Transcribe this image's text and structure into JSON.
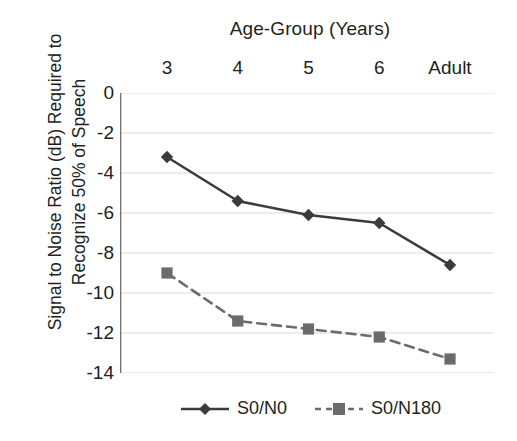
{
  "chart_data": {
    "type": "line",
    "title": "",
    "xlabel": "Age-Group (Years)",
    "ylabel": "Signal to Noise Ratio (dB) Required to\nRecognize 50% of Speech",
    "categories": [
      "3",
      "4",
      "5",
      "6",
      "Adult"
    ],
    "ylim": [
      -14,
      0
    ],
    "yticks": [
      0,
      -2,
      -4,
      -6,
      -8,
      -10,
      -12,
      -14
    ],
    "ytick_labels": [
      "0",
      "-2",
      "-4",
      "-6",
      "-8",
      "-10",
      "-12",
      "-14"
    ],
    "grid": true,
    "xaxis_position": "top",
    "legend_position": "bottom",
    "series": [
      {
        "name": "S0/N0",
        "values": [
          -3.2,
          -5.4,
          -6.1,
          -6.5,
          -8.6
        ],
        "linestyle": "solid",
        "marker": "diamond",
        "color": "#3b3b3b"
      },
      {
        "name": "S0/N180",
        "values": [
          -9.0,
          -11.4,
          -11.8,
          -12.2,
          -13.3
        ],
        "linestyle": "dashed",
        "marker": "square",
        "color": "#6b6b6b"
      }
    ]
  },
  "legend": {
    "entries": [
      {
        "label": "S0/N0"
      },
      {
        "label": "S0/N180"
      }
    ]
  },
  "colors": {
    "series_solid": "#3b3b3b",
    "series_dashed": "#6b6b6b",
    "axis": "#808080",
    "grid": "#d9d9d9",
    "text": "#231f20",
    "background": "#ffffff"
  }
}
